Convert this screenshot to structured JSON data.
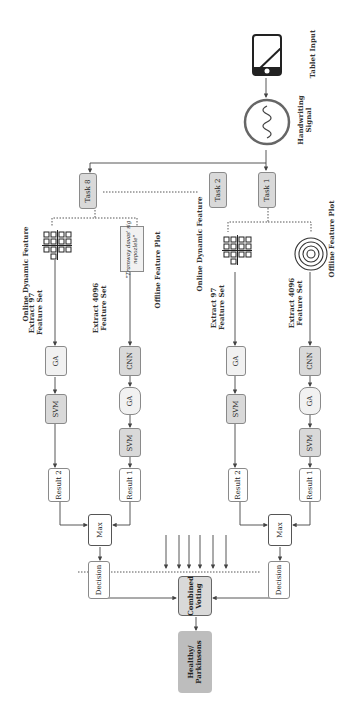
{
  "diagram": {
    "input": {
      "label": "Tablet Input",
      "icon": "tablet-icon"
    },
    "signal": {
      "label_line1": "Handwriting",
      "label_line2": "Signal",
      "icon": "sine-wave-icon"
    },
    "tasks": {
      "task1": "Task 1",
      "task2": "Task 2",
      "task8": "Task 8"
    },
    "branch_right": {
      "online_label": "Online Dynamic Feature",
      "offline_label": "Offline Feature Plot",
      "extract97_line1": "Extract 97",
      "extract97_line2": "Feature Set",
      "extract4096_line1": "Extract 4096",
      "extract4096_line2": "Feature Set",
      "ga_top": "GA",
      "svm_top": "SVM",
      "result_top": "Result 2",
      "cnn": "CNN",
      "ga_bottom": "GA",
      "svm_bottom": "SVM",
      "result_bottom": "Result 1",
      "max": "Max",
      "decision": "Decision"
    },
    "branch_left": {
      "online_label": "Online Dynamic Feature",
      "offline_label": "Offline Feature Plot",
      "extract97_line1": "Extract 97",
      "extract97_line2": "Feature Set",
      "extract4096_line1": "Extract 4096",
      "extract4096_line2": "Feature Set",
      "handwriting_sample_line1": "\"Tramway davas' sig",
      "handwriting_sample_line2": "nepozlele\"",
      "ga_top": "GA",
      "svm_top": "SVM",
      "result_top": "Result 2",
      "cnn": "CNN",
      "ga_bottom": "GA",
      "svm_bottom": "SVM",
      "result_bottom": "Result 1",
      "max": "Max",
      "decision": "Decision"
    },
    "combined": {
      "line1": "Combined",
      "line2": "Voting"
    },
    "output": {
      "line1": "Healthy/",
      "line2": "Parkinsons"
    },
    "colors": {
      "light_box": "#f1f1f1",
      "mid_box": "#d9d9d9",
      "dark_box": "#bdbdbd",
      "line": "#444444"
    }
  }
}
